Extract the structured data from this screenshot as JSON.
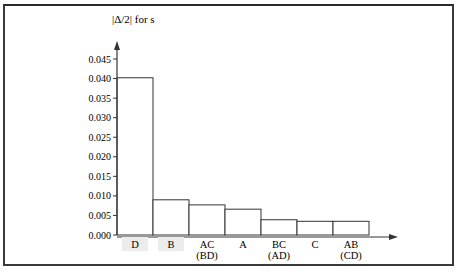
{
  "chart_data": {
    "type": "bar",
    "title": "|Δ/2| for s",
    "xlabel": "",
    "ylabel": "|Δ/2| for s",
    "categories": [
      {
        "main": "D",
        "alias": ""
      },
      {
        "main": "B",
        "alias": ""
      },
      {
        "main": "AC",
        "alias": "(BD)"
      },
      {
        "main": "A",
        "alias": ""
      },
      {
        "main": "BC",
        "alias": "(AD)"
      },
      {
        "main": "C",
        "alias": ""
      },
      {
        "main": "AB",
        "alias": "(CD)"
      }
    ],
    "values": [
      0.0402,
      0.009,
      0.0077,
      0.0066,
      0.0039,
      0.0035,
      0.0035
    ],
    "ylim": [
      0,
      0.045
    ],
    "yticks": [
      "0.000",
      "0.005",
      "0.010",
      "0.015",
      "0.020",
      "0.025",
      "0.030",
      "0.035",
      "0.040",
      "0.045"
    ],
    "grid": false,
    "legend": null,
    "highlighted_labels": [
      "D",
      "B"
    ],
    "colors": {
      "bar_fill": "#ffffff",
      "bar_stroke": "#333333",
      "axis": "#333333",
      "label_highlight": "#ececec"
    }
  }
}
